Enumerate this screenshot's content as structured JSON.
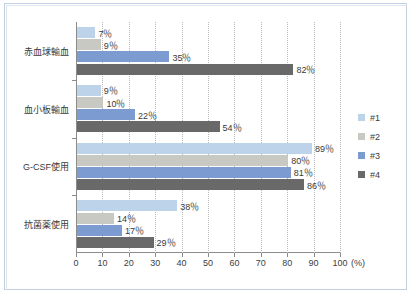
{
  "chart_data": {
    "type": "bar",
    "orientation": "horizontal",
    "title": "",
    "xlabel": "",
    "ylabel": "",
    "unit_label": "(%)",
    "xlim": [
      0,
      100
    ],
    "xticks": [
      0,
      10,
      20,
      30,
      40,
      50,
      60,
      70,
      80,
      90,
      100
    ],
    "xtick_labels": [
      "0",
      "10",
      "20",
      "30",
      "40",
      "50",
      "60",
      "70",
      "80",
      "90",
      "100"
    ],
    "grid": true,
    "grid_axis": "x",
    "grid_style": "dotted",
    "legend_position": "right",
    "categories": [
      "赤血球輸血",
      "血小板輸血",
      "G-CSF使用",
      "抗菌薬使用"
    ],
    "series": [
      {
        "name": "#1",
        "color": "#bdd3ea",
        "values": [
          7,
          9,
          89,
          38
        ],
        "labels": [
          "7％",
          "9％",
          "89％",
          "38％"
        ]
      },
      {
        "name": "#2",
        "color": "#c9c9c4",
        "values": [
          9,
          10,
          80,
          14
        ],
        "labels": [
          "9％",
          "10％",
          "80％",
          "14％"
        ]
      },
      {
        "name": "#3",
        "color": "#7c9cd1",
        "values": [
          35,
          22,
          81,
          17
        ],
        "labels": [
          "35％",
          "22％",
          "81％",
          "17％"
        ]
      },
      {
        "name": "#4",
        "color": "#696969",
        "values": [
          82,
          54,
          86,
          29
        ],
        "labels": [
          "82％",
          "54％",
          "86％",
          "29％"
        ]
      }
    ]
  },
  "colors": {
    "frame": "#c3cede",
    "axis": "#8c8c8c",
    "grid": "#b9b9b9",
    "text": "#3a3a3a",
    "background": "#ffffff"
  }
}
